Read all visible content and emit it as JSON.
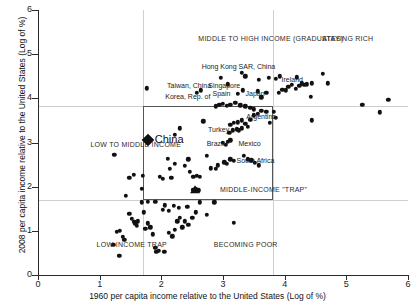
{
  "chart_data": {
    "type": "scatter",
    "title": "",
    "xlabel": "1960 per capita income relative to the United States  (Log of %)",
    "ylabel": "2008 per capita income relative to the United States  (Log of %)",
    "xlim": [
      0,
      6
    ],
    "ylim": [
      0,
      6
    ],
    "xticks": [
      0,
      1,
      2,
      3,
      4,
      5,
      6
    ],
    "yticks": [
      0,
      1,
      2,
      3,
      4,
      5,
      6
    ],
    "xtick_labels": [
      "0",
      "1",
      "2",
      "3",
      "4",
      "5",
      "6"
    ],
    "ytick_labels": [
      "0",
      "1",
      "2",
      "3",
      "4",
      "5",
      "6"
    ],
    "grid": true,
    "gridlines_h": [
      1.7,
      3.8
    ],
    "gridlines_v": [
      1.7,
      3.8
    ],
    "legend": "none",
    "marker_color": "#111111",
    "grid_color": "#cfcfcf",
    "axis_color": "#2b2b2b",
    "trap_box": {
      "x0": 1.7,
      "x1": 3.8,
      "y0": 1.7,
      "y1": 3.8
    },
    "region_labels": [
      {
        "text": "MIDDLE TO HIGH INCOME (GRADUATES)",
        "x": 2.6,
        "y": 5.35
      },
      {
        "text": "STAYING RICH",
        "x": 4.6,
        "y": 5.35
      },
      {
        "text": "LOW TO MIDDLE INCOME",
        "x": 0.85,
        "y": 2.95
      },
      {
        "text": "MIDDLE-INCOME \"TRAP\"",
        "x": 2.95,
        "y": 1.93
      },
      {
        "text": "LOW-INCOME TRAP",
        "x": 0.95,
        "y": 0.67
      },
      {
        "text": "BECOMING POOR",
        "x": 2.85,
        "y": 0.67
      }
    ],
    "highlight": {
      "name": "China",
      "x": 1.78,
      "y": 3.05,
      "marker": "diamond"
    },
    "country_labels": [
      {
        "name": "Hong Kong SAR, China",
        "x": 3.25,
        "y": 4.72,
        "anchor": "middle"
      },
      {
        "name": "Singapore",
        "x": 3.02,
        "y": 4.28,
        "anchor": "middle"
      },
      {
        "name": "Taiwan, China",
        "x": 2.45,
        "y": 4.27,
        "anchor": "middle"
      },
      {
        "name": "Korea, Rep. of",
        "x": 2.43,
        "y": 4.03,
        "anchor": "middle"
      },
      {
        "name": "Spain",
        "x": 3.12,
        "y": 4.1,
        "anchor": "end"
      },
      {
        "name": "Japan",
        "x": 3.52,
        "y": 4.1,
        "anchor": "middle"
      },
      {
        "name": "Ireland",
        "x": 3.95,
        "y": 4.42,
        "anchor": "start"
      },
      {
        "name": "Argentina",
        "x": 3.62,
        "y": 3.58,
        "anchor": "middle"
      },
      {
        "name": "Turkey",
        "x": 2.93,
        "y": 3.28,
        "anchor": "middle"
      },
      {
        "name": "Brazil",
        "x": 3.02,
        "y": 2.97,
        "anchor": "end"
      },
      {
        "name": "Mexico",
        "x": 3.25,
        "y": 2.97,
        "anchor": "start"
      },
      {
        "name": "South Africa",
        "x": 3.22,
        "y": 2.58,
        "anchor": "start"
      }
    ],
    "points": [
      {
        "x": 1.24,
        "y": 2.72
      },
      {
        "x": 1.42,
        "y": 1.8
      },
      {
        "x": 1.55,
        "y": 2.27
      },
      {
        "x": 1.48,
        "y": 2.2
      },
      {
        "x": 1.7,
        "y": 2.24
      },
      {
        "x": 1.68,
        "y": 1.95
      },
      {
        "x": 1.28,
        "y": 0.98
      },
      {
        "x": 1.33,
        "y": 1.0
      },
      {
        "x": 1.38,
        "y": 0.86
      },
      {
        "x": 1.22,
        "y": 0.68
      },
      {
        "x": 1.4,
        "y": 0.8
      },
      {
        "x": 1.32,
        "y": 0.43
      },
      {
        "x": 1.48,
        "y": 1.38
      },
      {
        "x": 1.52,
        "y": 1.27
      },
      {
        "x": 1.56,
        "y": 1.2
      },
      {
        "x": 1.58,
        "y": 1.17
      },
      {
        "x": 1.62,
        "y": 1.22
      },
      {
        "x": 1.6,
        "y": 1.12
      },
      {
        "x": 1.68,
        "y": 1.65
      },
      {
        "x": 1.72,
        "y": 1.42
      },
      {
        "x": 1.78,
        "y": 1.17
      },
      {
        "x": 1.82,
        "y": 1.08
      },
      {
        "x": 1.74,
        "y": 1.05
      },
      {
        "x": 1.86,
        "y": 0.92
      },
      {
        "x": 1.9,
        "y": 0.62
      },
      {
        "x": 1.92,
        "y": 0.53
      },
      {
        "x": 1.96,
        "y": 0.55
      },
      {
        "x": 2.05,
        "y": 0.53
      },
      {
        "x": 2.12,
        "y": 0.95
      },
      {
        "x": 2.18,
        "y": 0.88
      },
      {
        "x": 2.22,
        "y": 1.02
      },
      {
        "x": 2.26,
        "y": 1.22
      },
      {
        "x": 2.3,
        "y": 1.3
      },
      {
        "x": 2.34,
        "y": 1.08
      },
      {
        "x": 2.12,
        "y": 1.45
      },
      {
        "x": 2.02,
        "y": 1.48
      },
      {
        "x": 2.2,
        "y": 1.57
      },
      {
        "x": 2.28,
        "y": 1.52
      },
      {
        "x": 2.42,
        "y": 1.55
      },
      {
        "x": 2.38,
        "y": 1.22
      },
      {
        "x": 2.44,
        "y": 1.13
      },
      {
        "x": 2.5,
        "y": 1.3
      },
      {
        "x": 2.56,
        "y": 1.42
      },
      {
        "x": 2.62,
        "y": 1.65
      },
      {
        "x": 2.74,
        "y": 1.36
      },
      {
        "x": 2.86,
        "y": 1.65
      },
      {
        "x": 3.18,
        "y": 1.18
      },
      {
        "x": 1.78,
        "y": 1.66
      },
      {
        "x": 1.9,
        "y": 1.66
      },
      {
        "x": 2.06,
        "y": 1.58
      },
      {
        "x": 1.98,
        "y": 2.22
      },
      {
        "x": 2.02,
        "y": 2.18
      },
      {
        "x": 2.1,
        "y": 2.63
      },
      {
        "x": 2.14,
        "y": 2.4
      },
      {
        "x": 2.16,
        "y": 2.2
      },
      {
        "x": 2.22,
        "y": 2.52
      },
      {
        "x": 2.3,
        "y": 3.32
      },
      {
        "x": 2.22,
        "y": 3.18
      },
      {
        "x": 1.76,
        "y": 4.23
      },
      {
        "x": 2.38,
        "y": 2.47
      },
      {
        "x": 2.44,
        "y": 2.62
      },
      {
        "x": 2.46,
        "y": 2.33
      },
      {
        "x": 2.52,
        "y": 2.22
      },
      {
        "x": 2.58,
        "y": 2.25
      },
      {
        "x": 2.62,
        "y": 2.22
      },
      {
        "x": 2.52,
        "y": 1.93
      },
      {
        "x": 2.56,
        "y": 1.95
      },
      {
        "x": 2.6,
        "y": 1.92
      },
      {
        "x": 2.68,
        "y": 3.48
      },
      {
        "x": 2.74,
        "y": 2.7
      },
      {
        "x": 2.8,
        "y": 2.42
      },
      {
        "x": 2.88,
        "y": 2.4
      },
      {
        "x": 2.92,
        "y": 2.48
      },
      {
        "x": 3.02,
        "y": 2.55
      },
      {
        "x": 3.06,
        "y": 2.52
      },
      {
        "x": 3.0,
        "y": 3.0
      },
      {
        "x": 3.08,
        "y": 3.02
      },
      {
        "x": 3.12,
        "y": 3.05
      },
      {
        "x": 3.05,
        "y": 2.95
      },
      {
        "x": 3.1,
        "y": 3.22
      },
      {
        "x": 3.16,
        "y": 3.28
      },
      {
        "x": 3.22,
        "y": 3.3
      },
      {
        "x": 3.26,
        "y": 3.28
      },
      {
        "x": 3.3,
        "y": 3.32
      },
      {
        "x": 3.12,
        "y": 3.4
      },
      {
        "x": 3.18,
        "y": 3.44
      },
      {
        "x": 3.24,
        "y": 3.46
      },
      {
        "x": 3.3,
        "y": 3.5
      },
      {
        "x": 3.36,
        "y": 3.42
      },
      {
        "x": 3.4,
        "y": 3.36
      },
      {
        "x": 3.34,
        "y": 2.7
      },
      {
        "x": 3.4,
        "y": 2.62
      },
      {
        "x": 3.46,
        "y": 2.6
      },
      {
        "x": 3.52,
        "y": 2.54
      },
      {
        "x": 3.58,
        "y": 2.48
      },
      {
        "x": 3.12,
        "y": 2.62
      },
      {
        "x": 3.18,
        "y": 2.58
      },
      {
        "x": 3.44,
        "y": 3.52
      },
      {
        "x": 3.5,
        "y": 3.62
      },
      {
        "x": 3.56,
        "y": 3.65
      },
      {
        "x": 3.62,
        "y": 3.72
      },
      {
        "x": 3.7,
        "y": 3.7
      },
      {
        "x": 3.76,
        "y": 3.45
      },
      {
        "x": 3.82,
        "y": 3.7
      },
      {
        "x": 3.86,
        "y": 3.56
      },
      {
        "x": 2.88,
        "y": 3.82
      },
      {
        "x": 2.94,
        "y": 3.85
      },
      {
        "x": 3.0,
        "y": 3.88
      },
      {
        "x": 3.06,
        "y": 3.83
      },
      {
        "x": 3.12,
        "y": 3.86
      },
      {
        "x": 3.2,
        "y": 3.9
      },
      {
        "x": 3.28,
        "y": 3.84
      },
      {
        "x": 3.36,
        "y": 3.82
      },
      {
        "x": 3.44,
        "y": 3.78
      },
      {
        "x": 3.5,
        "y": 3.75
      },
      {
        "x": 3.3,
        "y": 4.58
      },
      {
        "x": 3.36,
        "y": 4.5
      },
      {
        "x": 2.58,
        "y": 4.12
      },
      {
        "x": 2.64,
        "y": 4.18
      },
      {
        "x": 3.08,
        "y": 4.32
      },
      {
        "x": 3.24,
        "y": 4.1
      },
      {
        "x": 3.32,
        "y": 4.18
      },
      {
        "x": 3.56,
        "y": 4.16
      },
      {
        "x": 3.62,
        "y": 4.02
      },
      {
        "x": 3.7,
        "y": 4.12
      },
      {
        "x": 3.74,
        "y": 4.46
      },
      {
        "x": 3.86,
        "y": 4.44
      },
      {
        "x": 3.92,
        "y": 4.5
      },
      {
        "x": 4.02,
        "y": 4.18
      },
      {
        "x": 4.06,
        "y": 4.26
      },
      {
        "x": 4.12,
        "y": 4.3
      },
      {
        "x": 4.18,
        "y": 4.22
      },
      {
        "x": 4.24,
        "y": 4.28
      },
      {
        "x": 4.28,
        "y": 4.34
      },
      {
        "x": 4.32,
        "y": 4.3
      },
      {
        "x": 4.36,
        "y": 4.32
      },
      {
        "x": 4.2,
        "y": 4.48
      },
      {
        "x": 4.44,
        "y": 4.34
      },
      {
        "x": 4.62,
        "y": 4.56
      },
      {
        "x": 4.7,
        "y": 4.34
      },
      {
        "x": 4.42,
        "y": 4.04
      },
      {
        "x": 4.44,
        "y": 3.5
      },
      {
        "x": 5.26,
        "y": 3.86
      },
      {
        "x": 5.54,
        "y": 3.68
      },
      {
        "x": 5.68,
        "y": 3.96
      },
      {
        "x": 3.58,
        "y": 4.42
      },
      {
        "x": 2.96,
        "y": 4.46
      },
      {
        "x": 3.9,
        "y": 4.12
      },
      {
        "x": 3.96,
        "y": 4.2
      }
    ]
  }
}
